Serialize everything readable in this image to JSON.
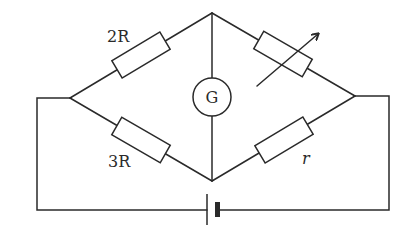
{
  "diagram": {
    "type": "Wheatstone bridge circuit",
    "components": {
      "resistor_top_left": {
        "label": "2R"
      },
      "resistor_bottom_left": {
        "label": "3R"
      },
      "resistor_top_right": {
        "label": "",
        "kind": "variable resistor (rheostat)"
      },
      "resistor_bottom_right": {
        "label": "r"
      },
      "galvanometer": {
        "label": "G"
      },
      "battery": {
        "label": ""
      }
    },
    "colors": {
      "stroke": "#2a2a2a",
      "background": "#ffffff"
    }
  }
}
